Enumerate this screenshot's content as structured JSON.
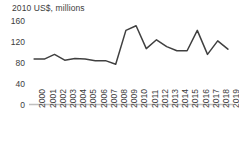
{
  "chart_data": {
    "type": "line",
    "title": "2010 US$, millions",
    "xlabel": "",
    "ylabel": "2010 US$, millions",
    "ylim": [
      0,
      160
    ],
    "yticks": [
      0,
      40,
      80,
      120,
      160
    ],
    "grid": false,
    "legend": null,
    "categories": [
      "2000",
      "2001",
      "2002",
      "2003",
      "2004",
      "2005",
      "2006",
      "2007",
      "2008",
      "2009",
      "2010",
      "2011",
      "2012",
      "2013",
      "2014",
      "2015",
      "2016",
      "2017",
      "2018",
      "2019"
    ],
    "series": [
      {
        "name": "2010 US$, millions",
        "color": "#404040",
        "values": [
          87,
          87,
          96,
          85,
          88,
          87,
          84,
          84,
          77,
          142,
          151,
          107,
          124,
          111,
          103,
          103,
          142,
          96,
          122,
          106
        ]
      }
    ]
  },
  "axis": {
    "y_tick_labels": [
      "160",
      "120",
      "80",
      "40",
      "0"
    ],
    "x_tick_labels": [
      "2000",
      "2001",
      "2002",
      "2003",
      "2004",
      "2005",
      "2006",
      "2007",
      "2008",
      "2009",
      "2010",
      "2011",
      "2012",
      "2013",
      "2014",
      "2015",
      "2016",
      "2017",
      "2018",
      "2019"
    ]
  },
  "style": {
    "line_color": "#404040",
    "axis_color": "#bfbfbf",
    "text_color": "#3c3c3c",
    "background": "#ffffff"
  }
}
